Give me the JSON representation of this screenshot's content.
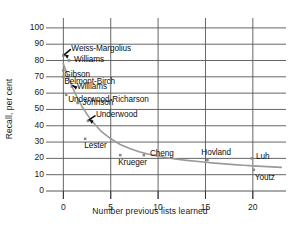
{
  "chart_data": {
    "type": "scatter",
    "title": "",
    "xlabel": "Number previous lists learned",
    "ylabel": "Recall, per cent",
    "xlim": [
      -1.2,
      23.5
    ],
    "ylim": [
      0,
      103
    ],
    "xticks": [
      0,
      5,
      10,
      15,
      20
    ],
    "yticks": [
      0,
      10,
      20,
      30,
      40,
      50,
      60,
      70,
      80,
      90,
      100
    ],
    "grid": true,
    "grid_color": "#555555",
    "marker_color": "#8a8a8a",
    "curve_color": "#999999",
    "points": [
      {
        "label": "Weiss-Margolius",
        "x": 0.0,
        "y": 83.0,
        "label_dx": 8,
        "label_dy": -7,
        "pointer": true
      },
      {
        "label": "Williams",
        "x": 0.6,
        "y": 80.0,
        "label_dx": 5,
        "label_dy": -1,
        "pointer": false
      },
      {
        "label": "Gibson",
        "x": 0.0,
        "y": 74.0,
        "label_dx": 1,
        "label_dy": 5,
        "pointer": false
      },
      {
        "label": "Belmont-Birch",
        "x": 0.0,
        "y": 70.0,
        "label_dx": 1,
        "label_dy": 5,
        "pointer": false
      },
      {
        "label": "Williams",
        "x": 0.9,
        "y": 64.0,
        "label_dx": 5,
        "label_dy": 0,
        "pointer": true
      },
      {
        "label": "Underwood-Richarson",
        "x": 0.3,
        "y": 59.0,
        "label_dx": 2,
        "label_dy": 5,
        "pointer": false
      },
      {
        "label": "Johnson",
        "x": 1.5,
        "y": 54.0,
        "label_dx": 5,
        "label_dy": 0,
        "pointer": false
      },
      {
        "label": "Underwood",
        "x": 2.6,
        "y": 43.0,
        "label_dx": 8,
        "label_dy": -6,
        "pointer": true
      },
      {
        "label": "Lester",
        "x": 2.3,
        "y": 32.0,
        "label_dx": -1,
        "label_dy": 7,
        "pointer": false
      },
      {
        "label": "Krueger",
        "x": 6.0,
        "y": 22.0,
        "label_dx": -2,
        "label_dy": 8,
        "pointer": false
      },
      {
        "label": "Cheng",
        "x": 8.5,
        "y": 22.0,
        "label_dx": 6,
        "label_dy": -1,
        "pointer": false
      },
      {
        "label": "Hovland",
        "x": 15.2,
        "y": 19.0,
        "label_dx": -6,
        "label_dy": -7,
        "pointer": false
      },
      {
        "label": "Luh",
        "x": 19.9,
        "y": 20.0,
        "label_dx": 4,
        "label_dy": -1,
        "pointer": false
      },
      {
        "label": "Youtz",
        "x": 20.1,
        "y": 13.0,
        "label_dx": 1,
        "label_dy": 8,
        "pointer": false
      }
    ],
    "curve": [
      {
        "x": 0.0,
        "y": 78.0
      },
      {
        "x": 0.5,
        "y": 70.0
      },
      {
        "x": 1.0,
        "y": 63.0
      },
      {
        "x": 1.5,
        "y": 57.0
      },
      {
        "x": 2.0,
        "y": 51.5
      },
      {
        "x": 2.5,
        "y": 47.0
      },
      {
        "x": 3.0,
        "y": 43.0
      },
      {
        "x": 4.0,
        "y": 36.5
      },
      {
        "x": 5.0,
        "y": 32.0
      },
      {
        "x": 6.0,
        "y": 28.5
      },
      {
        "x": 7.0,
        "y": 26.0
      },
      {
        "x": 8.0,
        "y": 24.0
      },
      {
        "x": 9.0,
        "y": 22.5
      },
      {
        "x": 10.0,
        "y": 21.3
      },
      {
        "x": 11.0,
        "y": 20.3
      },
      {
        "x": 12.0,
        "y": 19.5
      },
      {
        "x": 13.0,
        "y": 18.8
      },
      {
        "x": 14.0,
        "y": 18.2
      },
      {
        "x": 15.0,
        "y": 17.6
      },
      {
        "x": 16.0,
        "y": 17.1
      },
      {
        "x": 17.0,
        "y": 16.6
      },
      {
        "x": 18.0,
        "y": 16.2
      },
      {
        "x": 19.0,
        "y": 15.8
      },
      {
        "x": 20.0,
        "y": 15.4
      },
      {
        "x": 21.0,
        "y": 15.1
      },
      {
        "x": 22.0,
        "y": 14.8
      },
      {
        "x": 23.0,
        "y": 14.5
      }
    ]
  }
}
